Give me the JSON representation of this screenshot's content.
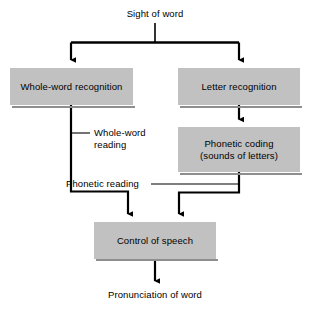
{
  "diagram": {
    "title_text": "Sight of word",
    "output_text": "Pronunciation of word",
    "background_color": "#ffffff",
    "box_fill_color": "#c1c1c1",
    "line_color": "#000000",
    "nodes": [
      {
        "id": "whole_word_recognition",
        "label": "Whole-word recognition"
      },
      {
        "id": "letter_recognition",
        "label": "Letter recognition"
      },
      {
        "id": "phonetic_coding",
        "label_line1": "Phonetic coding",
        "label_line2": "(sounds of letters)"
      },
      {
        "id": "control_of_speech",
        "label": "Control of speech"
      }
    ],
    "edge_labels": [
      {
        "id": "whole_word_reading",
        "line1": "Whole-word",
        "line2": "reading"
      },
      {
        "id": "phonetic_reading",
        "text": "Phonetic reading"
      }
    ]
  }
}
